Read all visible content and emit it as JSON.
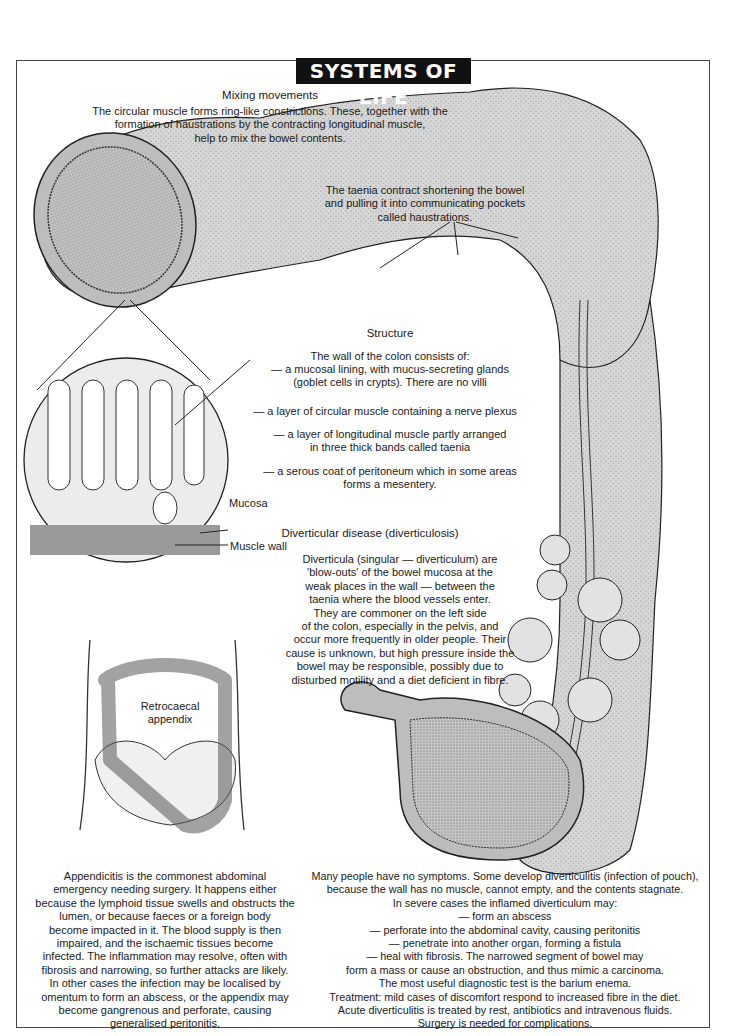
{
  "banner": {
    "title": "SYSTEMS OF LIFE"
  },
  "mixing": {
    "heading": "Mixing movements",
    "lines": [
      "The circular muscle forms ring-like constrictions. These, together with the",
      "formation of haustrations by the contracting longitudinal muscle,",
      "help to mix the bowel contents."
    ]
  },
  "taenia": {
    "lines": [
      "The taenia contract shortening the bowel",
      "and pulling it into communicating pockets",
      "called haustrations."
    ]
  },
  "structure": {
    "heading": "Structure",
    "intro": "The wall of the colon consists of:",
    "items": [
      [
        "— a mucosal lining, with mucus-secreting glands",
        "(goblet cells in crypts). There are no villi"
      ],
      [
        "— a layer of circular muscle containing a nerve plexus"
      ],
      [
        "— a layer of longitudinal muscle partly arranged",
        "in three  thick bands called taenia"
      ],
      [
        "— a serous coat of peritoneum which in some areas",
        "forms a mesentery."
      ]
    ]
  },
  "inset_labels": {
    "mucosa": "Mucosa",
    "muscle_wall": "Muscle wall"
  },
  "diverticular": {
    "heading": "Diverticular disease (diverticulosis)",
    "lines": [
      "Diverticula (singular — diverticulum) are",
      "'blow-outs' of the bowel mucosa at the",
      "weak places in the wall — between the",
      "taenia where the blood vessels enter.",
      "They are commoner on the left side",
      "of the colon, especially in the pelvis, and",
      "occur more frequently in older people. Their",
      "cause is unknown, but high pressure inside the",
      "bowel may be responsible, possibly due to",
      "disturbed motility and a diet deficient in fibre."
    ]
  },
  "appendix_figure": {
    "label_line1": "Retrocaecal",
    "label_line2": "appendix"
  },
  "appendicitis": {
    "lines": [
      "Appendicitis is the commonest abdominal",
      "emergency needing surgery. It happens either",
      "because the lymphoid tissue swells and obstructs the",
      "lumen, or because faeces or a foreign body",
      "become impacted in it. The blood supply is then",
      "impaired, and the ischaemic tissues become",
      "infected. The inflammation may resolve, often with",
      "fibrosis and narrowing, so further attacks are likely.",
      "In other cases the infection may be localised by",
      "omentum to form an abscess, or the appendix may",
      "become gangrenous and perforate, causing",
      "generalised peritonitis."
    ]
  },
  "diverticulitis": {
    "lines": [
      "Many people have no symptoms. Some develop diverticulitis (infection of pouch),",
      "because the wall has no muscle, cannot empty, and the contents stagnate.",
      "In severe cases the inflamed diverticulum may:",
      "— form an abscess",
      "— perforate into the abdominal cavity, causing peritonitis",
      "— penetrate into another organ, forming a fistula",
      "— heal with fibrosis. The narrowed segment of bowel may",
      "form a mass or cause an obstruction, and thus mimic a carcinoma.",
      "The most useful diagnostic test is the barium enema.",
      "Treatment: mild cases of discomfort respond to increased fibre in the diet.",
      "Acute diverticulitis is treated by rest, antibiotics and intravenous fluids.",
      "Surgery is needed for complications."
    ]
  },
  "colors": {
    "tissue": "#d4d4d4",
    "tissue_dark": "#9a9a9a",
    "ink": "#1a1a1a",
    "banner_bg": "#111111"
  }
}
